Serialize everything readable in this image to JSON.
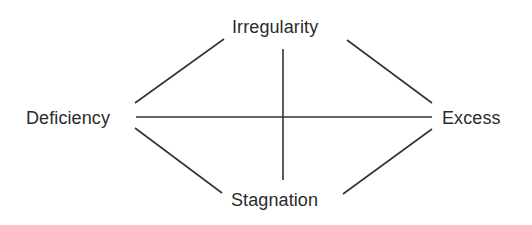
{
  "diagram": {
    "type": "diamond-cross",
    "colors": {
      "background": "#ffffff",
      "line": "#333333",
      "text": "#2b2b2b"
    },
    "nodes": {
      "top": {
        "label": "Irregularity"
      },
      "left": {
        "label": "Deficiency"
      },
      "right": {
        "label": "Excess"
      },
      "bottom": {
        "label": "Stagnation"
      }
    },
    "edges": [
      {
        "from": "left",
        "to": "top"
      },
      {
        "from": "top",
        "to": "right"
      },
      {
        "from": "left",
        "to": "bottom"
      },
      {
        "from": "bottom",
        "to": "right"
      },
      {
        "from": "left",
        "to": "right",
        "kind": "horizontal-axis"
      },
      {
        "from": "top",
        "to": "bottom",
        "kind": "vertical-axis"
      }
    ]
  }
}
